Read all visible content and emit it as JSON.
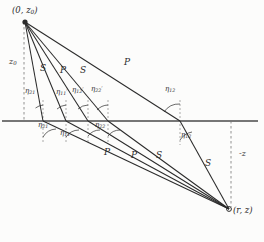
{
  "figure": {
    "type": "ray-path-diagram",
    "background_color": "#fcfcfb",
    "line_color": "#2b2b2b",
    "interface_color": "#555555"
  },
  "points": {
    "source": {
      "label_text": "(0, z",
      "label_sub": "0",
      "label_tail": ")",
      "x": 22,
      "y": 17
    },
    "receiver": {
      "label_text": "(r, z)",
      "x": 229,
      "y": 211,
      "marker": "circle"
    }
  },
  "axes": {
    "depth_source": {
      "label": "z",
      "sub": "0",
      "x": 11,
      "y": 62
    },
    "depth_receiver": {
      "label": "-z",
      "x": 243,
      "y": 154
    }
  },
  "interface": {
    "name": "horizontal-interface",
    "y": 121,
    "x_start": 2,
    "x_end": 258
  },
  "rays": [
    {
      "id": "ray-1",
      "phase": "S",
      "label": "S",
      "lx": 42,
      "ly": 68
    },
    {
      "id": "ray-2",
      "phase": "P",
      "label": "P",
      "lx": 62,
      "ly": 70
    },
    {
      "id": "ray-3",
      "phase": "S",
      "label": "S",
      "lx": 82,
      "ly": 70
    },
    {
      "id": "ray-4",
      "phase": "P",
      "label": "P",
      "lx": 126,
      "ly": 62
    },
    {
      "id": "ray-5",
      "phase": "P",
      "label": "P",
      "lx": 106,
      "ly": 152
    },
    {
      "id": "ray-6",
      "phase": "P",
      "label": "P",
      "lx": 133,
      "ly": 155
    },
    {
      "id": "ray-7",
      "phase": "S",
      "label": "S",
      "lx": 158,
      "ly": 155
    },
    {
      "id": "ray-8",
      "phase": "S",
      "label": "S",
      "lx": 207,
      "ly": 163
    }
  ],
  "angles": [
    {
      "id": "angle-eta-21-upper",
      "sym": "η",
      "sub": "21",
      "prime": false,
      "x": 27,
      "y": 92
    },
    {
      "id": "angle-eta-11-upper",
      "sym": "η",
      "sub": "11",
      "prime": true,
      "x": 58,
      "y": 93
    },
    {
      "id": "angle-eta-12-upper",
      "sym": "η",
      "sub": "12",
      "prime": true,
      "x": 74,
      "y": 91
    },
    {
      "id": "angle-eta-22-upper",
      "sym": "η",
      "sub": "22",
      "prime": true,
      "x": 93,
      "y": 90
    },
    {
      "id": "angle-eta-12-right",
      "sym": "η",
      "sub": "12",
      "prime": false,
      "x": 167,
      "y": 90
    },
    {
      "id": "angle-eta-21-lower",
      "sym": "η",
      "sub": "21",
      "prime": true,
      "x": 40,
      "y": 126
    },
    {
      "id": "angle-eta-11-lower",
      "sym": "η",
      "sub": "11",
      "prime": false,
      "x": 62,
      "y": 134
    },
    {
      "id": "angle-eta-22-lower",
      "sym": "η",
      "sub": "22",
      "prime": false,
      "x": 97,
      "y": 126
    },
    {
      "id": "angle-eta-12-lowerright",
      "sym": "η",
      "sub": "12",
      "prime": false,
      "x": 183,
      "y": 136
    }
  ]
}
